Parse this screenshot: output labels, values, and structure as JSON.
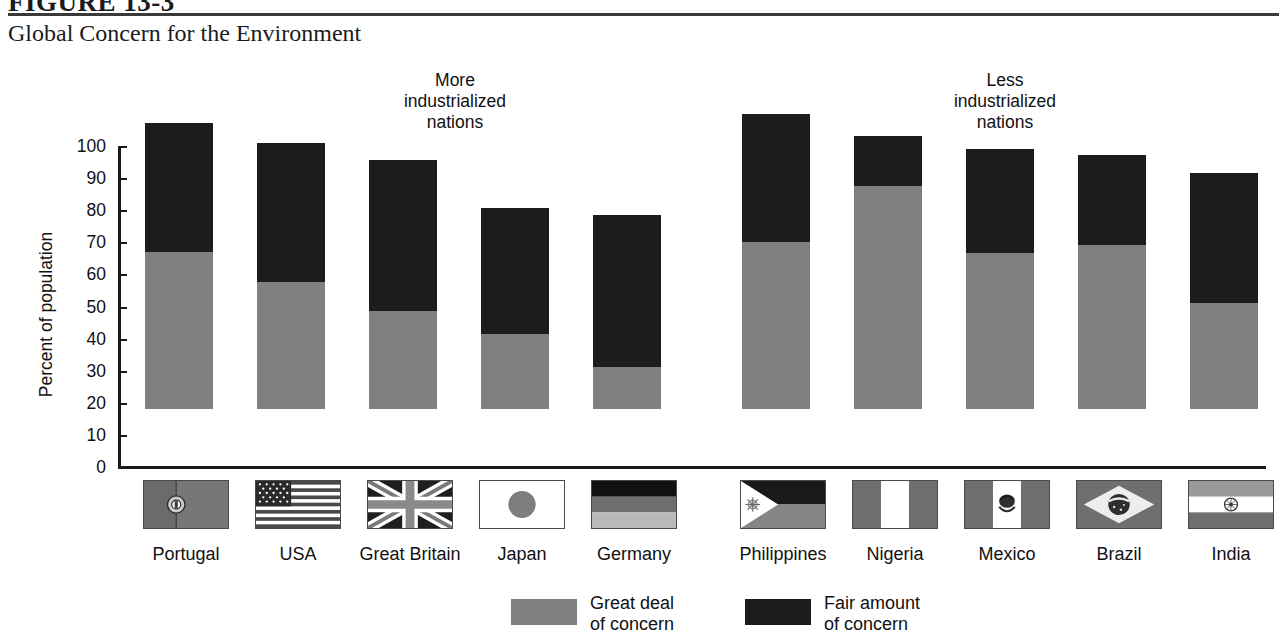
{
  "figure": {
    "number": "FIGURE 13-3",
    "title": "Global Concern for the Environment"
  },
  "groups": {
    "more": "More\nindustrialized\nnations",
    "less": "Less\nindustrialized\nnations"
  },
  "axis": {
    "y_title": "Percent of population",
    "ticks": [
      "100",
      "90",
      "80",
      "70",
      "60",
      "50",
      "40",
      "30",
      "20",
      "10",
      "0"
    ]
  },
  "legend": {
    "items": [
      {
        "label": "Great deal\nof concern",
        "color": "#808080",
        "icon": "legend-swatch-gray"
      },
      {
        "label": "Fair amount\nof concern",
        "color": "#1c1c1c",
        "icon": "legend-swatch-dark"
      }
    ]
  },
  "countries": [
    {
      "name": "Portugal",
      "flag": "flag-portugal"
    },
    {
      "name": "USA",
      "flag": "flag-usa"
    },
    {
      "name": "Great Britain",
      "flag": "flag-great-britain"
    },
    {
      "name": "Japan",
      "flag": "flag-japan"
    },
    {
      "name": "Germany",
      "flag": "flag-germany"
    },
    {
      "name": "Philippines",
      "flag": "flag-philippines"
    },
    {
      "name": "Nigeria",
      "flag": "flag-nigeria"
    },
    {
      "name": "Mexico",
      "flag": "flag-mexico"
    },
    {
      "name": "Brazil",
      "flag": "flag-brazil"
    },
    {
      "name": "India",
      "flag": "flag-india"
    }
  ],
  "chart_data": {
    "type": "bar",
    "stacked": true,
    "title": "Global Concern for the Environment",
    "xlabel": "",
    "ylabel": "Percent of population",
    "ylim": [
      0,
      100
    ],
    "yticks": [
      0,
      10,
      20,
      30,
      40,
      50,
      60,
      70,
      80,
      90,
      100
    ],
    "grid": false,
    "legend_position": "bottom",
    "categories": [
      "Portugal",
      "USA",
      "Great Britain",
      "Japan",
      "Germany",
      "Philippines",
      "Nigeria",
      "Mexico",
      "Brazil",
      "India"
    ],
    "group_labels": [
      "More industrialized nations",
      "Less industrialized nations"
    ],
    "group_members": [
      [
        "Portugal",
        "USA",
        "Great Britain",
        "Japan",
        "Germany"
      ],
      [
        "Philippines",
        "Nigeria",
        "Mexico",
        "Brazil",
        "India"
      ]
    ],
    "series": [
      {
        "name": "Great deal of concern",
        "color": "#808080",
        "values": [
          49,
          39.5,
          30.5,
          23.5,
          13,
          52,
          69.5,
          48.5,
          51,
          33
        ]
      },
      {
        "name": "Fair amount of concern",
        "color": "#1c1c1c",
        "values": [
          40,
          43.5,
          47,
          39,
          47.5,
          40,
          15.5,
          32.5,
          28,
          40.5
        ]
      }
    ],
    "totals": [
      89,
      83,
      77.5,
      62.5,
      60.5,
      92,
      85,
      81,
      79,
      73.5
    ]
  }
}
